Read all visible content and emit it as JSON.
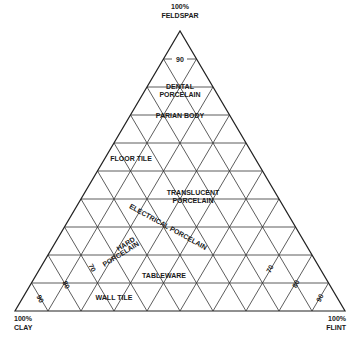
{
  "diagram": {
    "type": "ternary",
    "vertices": {
      "top": {
        "line1": "100%",
        "line2": "FELDSPAR"
      },
      "left": {
        "line1": "100%",
        "line2": "CLAY"
      },
      "right": {
        "line1": "100%",
        "line2": "FLINT"
      }
    },
    "divisions": 10,
    "colors": {
      "line": "#333333",
      "text": "#1a1a1a",
      "background": "#ffffff"
    },
    "tick_labels": {
      "top": "90",
      "left": [
        "70",
        "80",
        "90"
      ],
      "right": [
        "70",
        "80",
        "90"
      ]
    },
    "regions": {
      "dental_porcelain": {
        "line1": "DENTAL",
        "line2": "PORCELAIN"
      },
      "parian_body": "PARIAN BODY",
      "floor_tile": "FLOOR TILE",
      "translucent_porcelain": {
        "line1": "TRANSLUCENT",
        "line2": "PORCELAIN"
      },
      "electrical_porcelain": "ELECTRICAL PORCELAIN",
      "hard_porcelain": {
        "line1": "HARD",
        "line2": "PORCELAIN"
      },
      "tableware": "TABLEWARE",
      "wall_tile": "WALL TILE"
    }
  }
}
